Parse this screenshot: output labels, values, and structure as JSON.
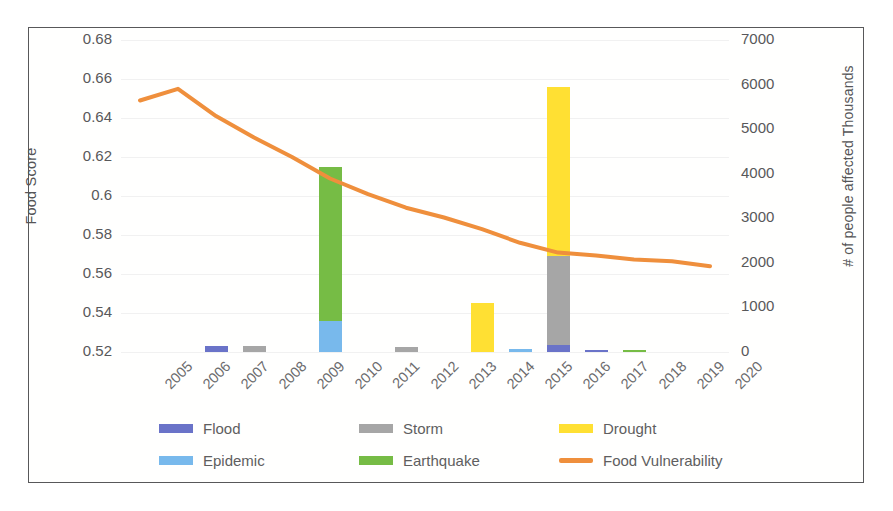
{
  "chart_data": {
    "type": "bar",
    "subtype": "stacked-bar-with-line-combo",
    "title": "",
    "xlabel": "",
    "ylabel": "Food Score",
    "y2label": "# of people affected Thousands",
    "categories": [
      "2005",
      "2006",
      "2007",
      "2008",
      "2009",
      "2010",
      "2011",
      "2012",
      "2013",
      "2014",
      "2015",
      "2016",
      "2017",
      "2018",
      "2019",
      "2020"
    ],
    "ylim": [
      0.52,
      0.68
    ],
    "ytick_step": 0.02,
    "yticks": [
      "0.68",
      "0.66",
      "0.64",
      "0.62",
      "0.6",
      "0.58",
      "0.56",
      "0.54",
      "0.52"
    ],
    "y2lim": [
      0,
      7000
    ],
    "y2tick_step": 1000,
    "y2ticks": [
      "7000",
      "6000",
      "5000",
      "4000",
      "3000",
      "2000",
      "1000",
      "0"
    ],
    "grid": true,
    "legend_position": "bottom",
    "series": [
      {
        "name": "Flood",
        "axis": "y2",
        "color": "#6a73c8",
        "values": [
          0,
          0,
          140,
          0,
          0,
          0,
          0,
          0,
          0,
          0,
          0,
          150,
          35,
          0,
          0,
          0
        ]
      },
      {
        "name": "Storm",
        "axis": "y2",
        "color": "#a6a6a6",
        "values": [
          0,
          0,
          0,
          130,
          0,
          0,
          0,
          120,
          0,
          0,
          0,
          2000,
          0,
          0,
          0,
          0
        ]
      },
      {
        "name": "Drought",
        "axis": "y2",
        "color": "#ffe033",
        "values": [
          0,
          0,
          0,
          0,
          0,
          0,
          0,
          0,
          0,
          1100,
          0,
          3800,
          0,
          0,
          0,
          0
        ]
      },
      {
        "name": "Epidemic",
        "axis": "y2",
        "color": "#78b9ec",
        "values": [
          0,
          0,
          0,
          0,
          0,
          700,
          0,
          0,
          0,
          0,
          60,
          0,
          0,
          0,
          0,
          0
        ]
      },
      {
        "name": "Earthquake",
        "axis": "y2",
        "color": "#76bc45",
        "values": [
          0,
          0,
          0,
          0,
          0,
          3450,
          0,
          0,
          0,
          0,
          0,
          0,
          0,
          40,
          0,
          0
        ]
      },
      {
        "name": "Food Vulnerability",
        "axis": "y",
        "color": "#ef8f3c",
        "type": "line",
        "values": [
          0.649,
          0.655,
          0.641,
          0.63,
          0.62,
          0.609,
          0.601,
          0.594,
          0.589,
          0.583,
          0.576,
          0.571,
          0.5695,
          0.5675,
          0.5665,
          0.564
        ]
      }
    ],
    "annotations": []
  },
  "legend": {
    "items": [
      {
        "label": "Flood",
        "color": "#6a73c8",
        "shape": "square"
      },
      {
        "label": "Storm",
        "color": "#a6a6a6",
        "shape": "square"
      },
      {
        "label": "Drought",
        "color": "#ffe033",
        "shape": "square"
      },
      {
        "label": "Epidemic",
        "color": "#78b9ec",
        "shape": "square"
      },
      {
        "label": "Earthquake",
        "color": "#76bc45",
        "shape": "square"
      },
      {
        "label": "Food Vulnerability",
        "color": "#ef8f3c",
        "shape": "line"
      }
    ]
  },
  "colors": {
    "border": "#58585a",
    "grid": "#f1f1f1",
    "text": "#58585a",
    "background": "#ffffff"
  }
}
